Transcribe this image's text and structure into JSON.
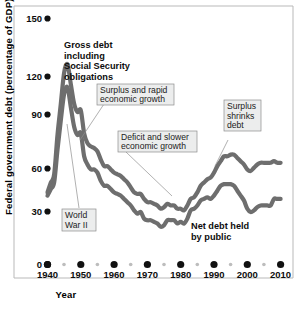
{
  "chart_data": {
    "type": "line",
    "title": "",
    "xlabel": "Year",
    "ylabel": "Federal government debt (percentage of GDP)",
    "xlim": [
      1938,
      2012
    ],
    "ylim": [
      0,
      150
    ],
    "yticks": [
      0,
      30,
      60,
      90,
      120,
      150
    ],
    "ytick_labels": [
      "0",
      "30",
      "60",
      "90",
      "120",
      "150"
    ],
    "xticks": [
      1940,
      1950,
      1960,
      1970,
      1980,
      1990,
      2000,
      2010
    ],
    "xtick_labels": [
      "1940",
      "1950",
      "1960",
      "1970",
      "1980",
      "1990",
      "2000",
      "2010"
    ],
    "xminor_ticks": [
      1945,
      1955,
      1965,
      1975,
      1985,
      1995,
      2005
    ],
    "grid": false,
    "legend_position": "inline-annotations",
    "line_color": "#6e6e6e",
    "series": [
      {
        "name": "Gross debt including Social Security obligations",
        "x": [
          1940,
          1941,
          1942,
          1943,
          1944,
          1945,
          1946,
          1947,
          1948,
          1949,
          1950,
          1951,
          1952,
          1953,
          1954,
          1955,
          1956,
          1957,
          1958,
          1959,
          1960,
          1961,
          1962,
          1963,
          1964,
          1965,
          1966,
          1967,
          1968,
          1969,
          1970,
          1971,
          1972,
          1973,
          1974,
          1975,
          1976,
          1977,
          1978,
          1979,
          1980,
          1981,
          1982,
          1983,
          1984,
          1985,
          1986,
          1987,
          1988,
          1989,
          1990,
          1991,
          1992,
          1993,
          1994,
          1995,
          1996,
          1997,
          1998,
          1999,
          2000,
          2001,
          2002,
          2003,
          2004,
          2005,
          2006,
          2007,
          2008,
          2009,
          2010
        ],
        "values": [
          44,
          50,
          55,
          79,
          98,
          117,
          122,
          110,
          98,
          93,
          94,
          80,
          74,
          72,
          71,
          69,
          64,
          60,
          60,
          58,
          56,
          55,
          54,
          52,
          50,
          47,
          44,
          43,
          43,
          40,
          38,
          38,
          37,
          36,
          34,
          35,
          37,
          36,
          36,
          34,
          34,
          33,
          36,
          40,
          41,
          44,
          48,
          50,
          52,
          53,
          56,
          60,
          63,
          66,
          66,
          67,
          67,
          65,
          63,
          61,
          58,
          57,
          59,
          61,
          62,
          62,
          62,
          62,
          63,
          62,
          62
        ]
      },
      {
        "name": "Net debt held by public",
        "x": [
          1940,
          1941,
          1942,
          1943,
          1944,
          1945,
          1946,
          1947,
          1948,
          1949,
          1950,
          1951,
          1952,
          1953,
          1954,
          1955,
          1956,
          1957,
          1958,
          1959,
          1960,
          1961,
          1962,
          1963,
          1964,
          1965,
          1966,
          1967,
          1968,
          1969,
          1970,
          1971,
          1972,
          1973,
          1974,
          1975,
          1976,
          1977,
          1978,
          1979,
          1980,
          1981,
          1982,
          1983,
          1984,
          1985,
          1986,
          1987,
          1988,
          1989,
          1990,
          1991,
          1992,
          1993,
          1994,
          1995,
          1996,
          1997,
          1998,
          1999,
          2000,
          2001,
          2002,
          2003,
          2004,
          2005,
          2006,
          2007,
          2008,
          2009,
          2010
        ],
        "values": [
          42,
          46,
          50,
          70,
          88,
          104,
          108,
          96,
          84,
          79,
          80,
          66,
          61,
          58,
          58,
          56,
          51,
          48,
          48,
          46,
          44,
          43,
          42,
          40,
          38,
          36,
          33,
          31,
          32,
          28,
          27,
          27,
          26,
          25,
          23,
          24,
          27,
          27,
          27,
          25,
          26,
          25,
          28,
          33,
          34,
          36,
          39,
          40,
          41,
          40,
          42,
          45,
          48,
          49,
          49,
          49,
          48,
          45,
          42,
          39,
          34,
          32,
          33,
          35,
          36,
          36,
          36,
          36,
          40,
          40,
          40
        ]
      }
    ],
    "annotations": [
      {
        "id": "gross-debt-label",
        "text": "Gross debt including Social Security obligations",
        "lines": [
          "Gross debt",
          "including",
          "Social Security",
          "obligations"
        ],
        "style": "bold-plain"
      },
      {
        "id": "surplus-rapid-growth",
        "text": "Surplus and rapid economic growth",
        "lines": [
          "Surplus and rapid",
          "economic growth"
        ],
        "style": "boxed"
      },
      {
        "id": "deficit-slower-growth",
        "text": "Deficit and slower economic growth",
        "lines": [
          "Deficit and slower",
          "economic growth"
        ],
        "style": "boxed"
      },
      {
        "id": "surplus-shrinks-debt",
        "text": "Surplus shrinks debt",
        "lines": [
          "Surplus",
          "shrinks",
          "debt"
        ],
        "style": "boxed"
      },
      {
        "id": "world-war-two",
        "text": "World War II",
        "lines": [
          "World",
          "War II"
        ],
        "style": "boxed"
      },
      {
        "id": "net-debt-label",
        "text": "Net debt held by public",
        "lines": [
          "Net debt held",
          "by public"
        ],
        "style": "bold-plain"
      }
    ]
  },
  "labels": {
    "y_axis_title": "Federal government debt (percentage of GDP)",
    "x_axis_title": "Year",
    "y_tick_150": "150",
    "y_tick_120": "120",
    "y_tick_90": "90",
    "y_tick_60": "60",
    "y_tick_30": "30",
    "y_tick_0": "0",
    "x_tick_1940": "1940",
    "x_tick_1950": "1950",
    "x_tick_1960": "1960",
    "x_tick_1970": "1970",
    "x_tick_1980": "1980",
    "x_tick_1990": "1990",
    "x_tick_2000": "2000",
    "x_tick_2010": "2010"
  },
  "annotations_text": {
    "gross_1": "Gross debt",
    "gross_2": "including",
    "gross_3": "Social Security",
    "gross_4": "obligations",
    "surplus_rapid_1": "Surplus and rapid",
    "surplus_rapid_2": "economic growth",
    "deficit_1": "Deficit and slower",
    "deficit_2": "economic growth",
    "shrinks_1": "Surplus",
    "shrinks_2": "shrinks",
    "shrinks_3": "debt",
    "ww2_1": "World",
    "ww2_2": "War II",
    "netdebt_1": "Net debt held",
    "netdebt_2": "by public"
  },
  "colors": {
    "line": "#6e6e6e",
    "axis_dot_major": "#111111",
    "axis_dot_minor": "#bdbdbd",
    "anno_box_fill": "#eceded",
    "anno_box_stroke": "#8d8d8d",
    "frame": "#b9b9b9"
  }
}
